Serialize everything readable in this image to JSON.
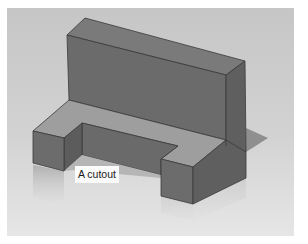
{
  "figure": {
    "background": {
      "top": "#c9c9c9",
      "bottom": "#e4e4e4",
      "page": "#ffffff"
    },
    "face_colors": {
      "front": "#6e6e6e",
      "side": "#5e5e5e",
      "top": "#9c9c9c",
      "edge": "#3a3a3a",
      "shadow": "#8a8a8a",
      "reflection": "#b8b8b8"
    },
    "callout": {
      "text": "A cutout",
      "x": 68,
      "y": 158
    }
  }
}
